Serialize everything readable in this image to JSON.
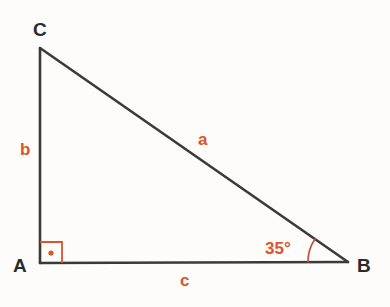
{
  "figure": {
    "type": "right-triangle-diagram",
    "background_color": "#fdfcfb",
    "stroke_color": "#3a3a3a",
    "accent_color": "#dd532c",
    "label_color": "#2b2b2b",
    "vertices": {
      "A": {
        "label": "A",
        "x": 40,
        "y": 263
      },
      "B": {
        "label": "B",
        "x": 348,
        "y": 262
      },
      "C": {
        "label": "C",
        "x": 40,
        "y": 48
      }
    },
    "sides": {
      "a": {
        "label": "a",
        "from": "B",
        "to": "C",
        "description": "hypotenuse"
      },
      "b": {
        "label": "b",
        "from": "A",
        "to": "C",
        "description": "vertical-leg"
      },
      "c": {
        "label": "c",
        "from": "A",
        "to": "B",
        "description": "horizontal-base"
      }
    },
    "angles": {
      "at_A": {
        "label": "",
        "value": "90",
        "marker": "right-angle-square-with-dot"
      },
      "at_B": {
        "label": "35°",
        "value": "35",
        "marker": "arc"
      }
    }
  }
}
